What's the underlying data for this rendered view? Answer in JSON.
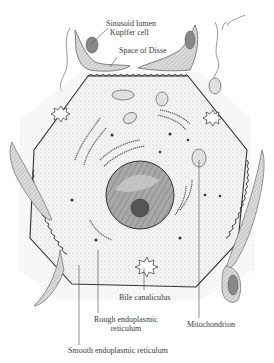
{
  "figure": {
    "signature": "L. Zamboni",
    "colors": {
      "ink": "#3a3a3a",
      "stipple": "#d8d8d8",
      "cytoplasm": "#efefef",
      "nucleus": "#9a9a9a",
      "background": "#ffffff"
    }
  },
  "labels": {
    "sinusoid_lumen": "Sinusoid lumen",
    "kupffer_cell": "Kupffer cell",
    "space_of_disse": "Space of Disse",
    "bile_canaliculus": "Bile canaliculus",
    "rough_er_line1": "Rough endoplasmic",
    "rough_er_line2": "reticulum",
    "mitochondrion": "Mitochondrion",
    "smooth_er": "Smooth endoplasmic reticulum"
  }
}
